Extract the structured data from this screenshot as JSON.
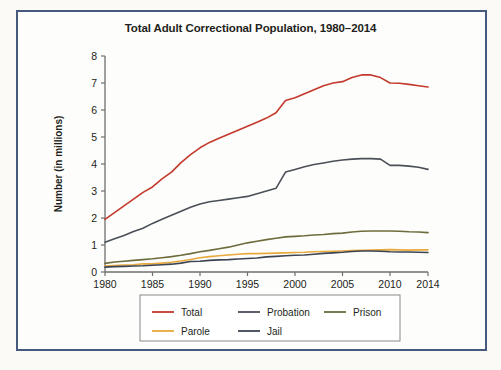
{
  "figure": {
    "background_color": "#fbfaf7",
    "frame_border_color": "#465a7e",
    "plot_background": "#fdfdfb"
  },
  "source_note": "",
  "chart_data": {
    "type": "line",
    "title": "Total Adult Correctional Population, 1980–2014",
    "xlabel": "",
    "ylabel": "Number (in millions)",
    "xlim": [
      1980,
      2014
    ],
    "ylim": [
      0,
      8
    ],
    "grid": false,
    "legend_position": "bottom",
    "xticks": [
      1980,
      1985,
      1990,
      1995,
      2000,
      2005,
      2010,
      2014
    ],
    "xtick_labels": [
      "1980",
      "1985",
      "1990",
      "1995",
      "2000",
      "2005",
      "2010",
      "2014"
    ],
    "yticks": [
      0,
      1,
      2,
      3,
      4,
      5,
      6,
      7,
      8
    ],
    "ytick_labels": [
      "0",
      "1",
      "2",
      "3",
      "4",
      "5",
      "6",
      "7",
      "8"
    ],
    "x": [
      1980,
      1981,
      1982,
      1983,
      1984,
      1985,
      1986,
      1987,
      1988,
      1989,
      1990,
      1991,
      1992,
      1993,
      1994,
      1995,
      1996,
      1997,
      1998,
      1999,
      2000,
      2001,
      2002,
      2003,
      2004,
      2005,
      2006,
      2007,
      2008,
      2009,
      2010,
      2011,
      2012,
      2013,
      2014
    ],
    "series": [
      {
        "name": "Total",
        "color": "#c4392c",
        "values": [
          1.95,
          2.2,
          2.45,
          2.7,
          2.95,
          3.15,
          3.45,
          3.7,
          4.05,
          4.35,
          4.6,
          4.8,
          4.95,
          5.1,
          5.25,
          5.4,
          5.55,
          5.7,
          5.9,
          6.35,
          6.45,
          6.6,
          6.75,
          6.9,
          7.0,
          7.05,
          7.2,
          7.3,
          7.3,
          7.2,
          7.0,
          6.99,
          6.95,
          6.9,
          6.85
        ]
      },
      {
        "name": "Probation",
        "color": "#4a4f58",
        "values": [
          1.1,
          1.23,
          1.35,
          1.5,
          1.62,
          1.8,
          1.95,
          2.1,
          2.25,
          2.4,
          2.52,
          2.6,
          2.65,
          2.7,
          2.75,
          2.8,
          2.9,
          3.0,
          3.1,
          3.7,
          3.8,
          3.9,
          3.98,
          4.04,
          4.1,
          4.15,
          4.18,
          4.2,
          4.2,
          4.18,
          3.95,
          3.95,
          3.92,
          3.88,
          3.8
        ]
      },
      {
        "name": "Prison",
        "color": "#6d6c3d",
        "values": [
          0.32,
          0.37,
          0.4,
          0.43,
          0.46,
          0.49,
          0.53,
          0.57,
          0.62,
          0.68,
          0.75,
          0.8,
          0.86,
          0.92,
          1.0,
          1.08,
          1.14,
          1.2,
          1.25,
          1.3,
          1.32,
          1.34,
          1.37,
          1.39,
          1.42,
          1.44,
          1.48,
          1.51,
          1.52,
          1.52,
          1.52,
          1.51,
          1.49,
          1.48,
          1.46
        ]
      },
      {
        "name": "Parole",
        "color": "#e8a93d",
        "values": [
          0.22,
          0.24,
          0.26,
          0.27,
          0.3,
          0.3,
          0.33,
          0.36,
          0.41,
          0.46,
          0.53,
          0.57,
          0.6,
          0.63,
          0.66,
          0.68,
          0.68,
          0.69,
          0.7,
          0.71,
          0.72,
          0.73,
          0.75,
          0.76,
          0.77,
          0.78,
          0.79,
          0.8,
          0.81,
          0.82,
          0.83,
          0.82,
          0.81,
          0.82,
          0.82
        ]
      },
      {
        "name": "Jail",
        "color": "#3c4454",
        "values": [
          0.18,
          0.2,
          0.21,
          0.22,
          0.23,
          0.25,
          0.27,
          0.29,
          0.33,
          0.39,
          0.4,
          0.43,
          0.45,
          0.46,
          0.48,
          0.5,
          0.52,
          0.56,
          0.58,
          0.6,
          0.62,
          0.63,
          0.66,
          0.69,
          0.71,
          0.73,
          0.76,
          0.78,
          0.78,
          0.77,
          0.75,
          0.74,
          0.74,
          0.73,
          0.72
        ]
      }
    ],
    "legend_entries": [
      {
        "label": "Total",
        "color": "#c4392c"
      },
      {
        "label": "Probation",
        "color": "#4a4f58"
      },
      {
        "label": "Prison",
        "color": "#6d6c3d"
      },
      {
        "label": "Parole",
        "color": "#e8a93d"
      },
      {
        "label": "Jail",
        "color": "#3c4454"
      }
    ]
  }
}
